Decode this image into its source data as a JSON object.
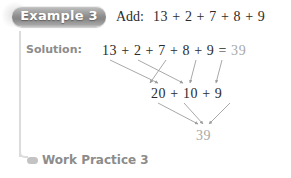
{
  "badge": {
    "label": "Example 3"
  },
  "headline": {
    "instruction": "Add:",
    "expression": "13 + 2 + 7 + 8 + 9"
  },
  "solution": {
    "label": "Solution:",
    "step1_expression": "13 + 2 + 7 + 8 + 9 =",
    "step1_answer": "39",
    "step2_expression": "20 + 10 + 9",
    "step3_answer": "39"
  },
  "footer": {
    "bullet": "oval-bullet-icon",
    "label": "Work Practice 3"
  },
  "colors": {
    "badge_text": "#ffffff",
    "badge_fill": "#8e8e8e",
    "label_gray": "#8c8c8c",
    "answer_gray": "#a9a9a9",
    "math_dark": "#2b2b2b",
    "rule_gray": "#dcdcdc",
    "arrow_gray": "#9e9e9e"
  }
}
